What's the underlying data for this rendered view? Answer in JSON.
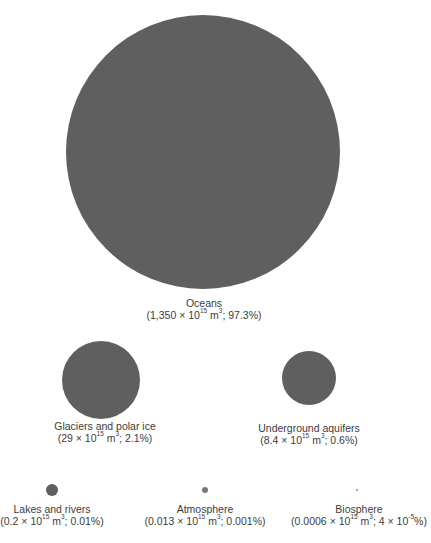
{
  "diagram": {
    "title": "",
    "fill_color": "#5f5f5f",
    "text_color": "#3c3c3c",
    "reservoirs": [
      {
        "id": "oceans",
        "name": "Oceans",
        "volume_mantissa": "1,350",
        "volume_exponent": "15",
        "volume_unit": "m",
        "unit_exponent": "3",
        "percent": "97.3%",
        "circle": {
          "cx": 203,
          "cy": 152,
          "d": 274
        },
        "label_pos": {
          "x": 204,
          "y": 298
        }
      },
      {
        "id": "glaciers",
        "name": "Glaciers and polar ice",
        "volume_mantissa": "29",
        "volume_exponent": "15",
        "volume_unit": "m",
        "unit_exponent": "3",
        "percent": "2.1%",
        "circle": {
          "cx": 101,
          "cy": 380,
          "d": 78
        },
        "label_pos": {
          "x": 105,
          "y": 421
        }
      },
      {
        "id": "aquifers",
        "name": "Underground aquifers",
        "volume_mantissa": "8.4",
        "volume_exponent": "15",
        "volume_unit": "m",
        "unit_exponent": "3",
        "percent": "0.6%",
        "circle": {
          "cx": 309,
          "cy": 378,
          "d": 54
        },
        "label_pos": {
          "x": 309,
          "y": 423
        }
      },
      {
        "id": "lakes",
        "name": "Lakes and rivers",
        "volume_mantissa": "0.2",
        "volume_exponent": "15",
        "volume_unit": "m",
        "unit_exponent": "3",
        "percent": "0.01%",
        "circle": {
          "cx": 52,
          "cy": 490,
          "d": 12
        },
        "label_pos": {
          "x": 52,
          "y": 504
        }
      },
      {
        "id": "atmosphere",
        "name": "Atmosphere",
        "volume_mantissa": "0.013",
        "volume_exponent": "15",
        "volume_unit": "m",
        "unit_exponent": "3",
        "percent": "0.001%",
        "circle": {
          "cx": 205,
          "cy": 490,
          "d": 6
        },
        "label_pos": {
          "x": 205,
          "y": 504
        }
      },
      {
        "id": "biosphere",
        "name": "Biosphere",
        "volume_mantissa": "0.0006",
        "volume_exponent": "15",
        "volume_unit": "m",
        "unit_exponent": "3",
        "percent_mantissa": "4",
        "percent_exponent": "-5",
        "percent_suffix": "%",
        "circle": {
          "cx": 357,
          "cy": 490,
          "d": 2
        },
        "label_pos": {
          "x": 359,
          "y": 504
        }
      }
    ],
    "symbols": {
      "times": "×",
      "ten": "10",
      "open": "(",
      "close": ")",
      "sep": "; "
    }
  }
}
